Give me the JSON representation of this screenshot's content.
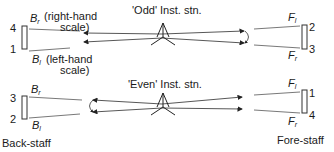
{
  "odd": {
    "station_label": "'Odd' Inst. stn.",
    "back_staff": {
      "top_number": "4",
      "bottom_number": "1"
    },
    "fore_staff": {
      "top_number": "2",
      "bottom_number": "3"
    },
    "br_label": "B",
    "br_sub": "r",
    "br_note": "(right-hand",
    "br_note2": "scale)",
    "bl_label": "B",
    "bl_sub": "l",
    "bl_note": "(left-hand",
    "bl_note2": "scale)",
    "fl_label": "F",
    "fl_sub": "l",
    "fr_label": "F",
    "fr_sub": "r"
  },
  "even": {
    "station_label": "'Even' Inst. stn.",
    "back_staff": {
      "top_number": "3",
      "bottom_number": "2"
    },
    "fore_staff": {
      "top_number": "1",
      "bottom_number": "4"
    },
    "br_label": "B",
    "br_sub": "r",
    "bl_label": "B",
    "bl_sub": "l",
    "fl_label": "F",
    "fl_sub": "l",
    "fr_label": "F",
    "fr_sub": "r"
  },
  "labels": {
    "back_staff": "Back-staff",
    "fore_staff": "Fore-staff"
  },
  "colors": {
    "line": "#333333",
    "text": "#1a1a1a"
  }
}
